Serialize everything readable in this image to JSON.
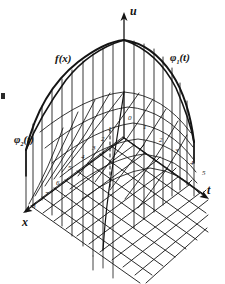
{
  "figure": {
    "kind": "hand-drawn 3d surface sketch"
  },
  "axes": {
    "vertical": {
      "name": "u-axis",
      "label": "u"
    },
    "right": {
      "name": "t-axis",
      "label": "t"
    },
    "left": {
      "name": "x-axis",
      "label": "x"
    }
  },
  "curves": {
    "initial": {
      "name": "f-of-x-curve",
      "label": "f(x)"
    },
    "boundary_right": {
      "name": "phi1-curve",
      "label": "φ",
      "sub": "1",
      "arg": "(t)"
    },
    "boundary_left": {
      "name": "phi2-curve",
      "label": "φ",
      "sub": "2",
      "arg": "(t)"
    }
  },
  "ticks": {
    "origin": "0",
    "t_axis": [
      "1",
      "2",
      "3",
      "4",
      "5"
    ],
    "x_axis": [
      "1",
      "2",
      "3",
      "4",
      "5",
      "6",
      "7",
      "8"
    ]
  },
  "colors": {
    "ink": "#141414",
    "paper": "#ffffff"
  }
}
